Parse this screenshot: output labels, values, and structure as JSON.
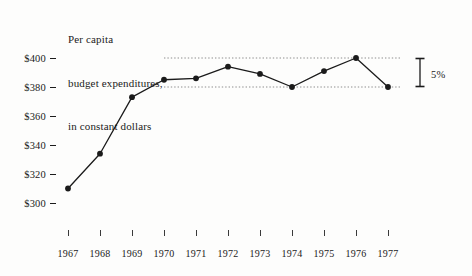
{
  "chart_data": {
    "type": "line",
    "title": "Per capita budget expenditures, in constant dollars",
    "title_lines": [
      "Per capita",
      "budget expenditures,",
      "in constant dollars"
    ],
    "xlabel": "",
    "ylabel": "",
    "categories": [
      "1967",
      "1968",
      "1969",
      "1970",
      "1971",
      "1972",
      "1973",
      "1974",
      "1975",
      "1976",
      "1977"
    ],
    "x": [
      1967,
      1968,
      1969,
      1970,
      1971,
      1972,
      1973,
      1974,
      1975,
      1976,
      1977
    ],
    "values": [
      310,
      334,
      373,
      385,
      386,
      394,
      389,
      380,
      391,
      400,
      380
    ],
    "ylim": [
      295,
      404
    ],
    "xlim": [
      1966.6,
      1977.4
    ],
    "y_ticks": [
      300,
      320,
      340,
      360,
      380,
      400
    ],
    "y_tick_labels": [
      "$300",
      "$320",
      "$340",
      "$360",
      "$380",
      "$400"
    ],
    "grid": false,
    "legend": false,
    "marker": "filled-circle",
    "line_color": "#1b1b1b",
    "marker_color": "#1b1b1b",
    "reference_lines": [
      {
        "value": 400,
        "style": "dotted",
        "from_year": 1970,
        "to_year": 1977
      },
      {
        "value": 380,
        "style": "dotted",
        "from_year": 1970,
        "to_year": 1977
      }
    ],
    "annotations": [
      {
        "name": "percent-range-bracket",
        "label": "5%",
        "spans_values": [
          380,
          400
        ],
        "position": "right-of-plot"
      }
    ]
  },
  "axis": {
    "y_labels": [
      "$400",
      "$380",
      "$360",
      "$340",
      "$320",
      "$300"
    ],
    "x_labels": [
      "1967",
      "1968",
      "1969",
      "1970",
      "1971",
      "1972",
      "1973",
      "1974",
      "1975",
      "1976",
      "1977"
    ]
  },
  "annotation": {
    "bracket_label": "5%"
  }
}
